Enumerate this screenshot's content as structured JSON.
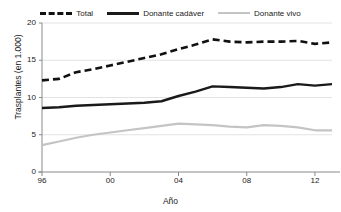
{
  "chart_data": {
    "type": "line",
    "title": "",
    "xlabel": "Año",
    "ylabel": "Trasplantes (en 1.000)",
    "xlim": [
      1996,
      2013
    ],
    "ylim": [
      0,
      20
    ],
    "grid": true,
    "legend_position": "top",
    "xticks": [
      "96",
      "00",
      "04",
      "08",
      "12"
    ],
    "xtick_values": [
      1996,
      2000,
      2004,
      2008,
      2012
    ],
    "yticks": [
      "0",
      "5",
      "10",
      "15",
      "20"
    ],
    "ytick_values": [
      0,
      5,
      10,
      15,
      20
    ],
    "x": [
      1996,
      1997,
      1998,
      1999,
      2000,
      2001,
      2002,
      2003,
      2004,
      2005,
      2006,
      2007,
      2008,
      2009,
      2010,
      2011,
      2012,
      2013
    ],
    "series": [
      {
        "name": "Total",
        "style": "dashed",
        "color": "#111111",
        "values": [
          12.3,
          12.5,
          13.4,
          13.8,
          14.3,
          14.8,
          15.3,
          15.8,
          16.5,
          17.1,
          17.8,
          17.5,
          17.4,
          17.5,
          17.5,
          17.6,
          17.2,
          17.4
        ]
      },
      {
        "name": "Donante cadáver",
        "style": "solid",
        "color": "#1a1a1a",
        "values": [
          8.6,
          8.7,
          8.9,
          9.0,
          9.1,
          9.2,
          9.3,
          9.5,
          10.2,
          10.8,
          11.5,
          11.4,
          11.3,
          11.2,
          11.4,
          11.8,
          11.6,
          11.8
        ]
      },
      {
        "name": "Donante vivo",
        "style": "solid",
        "color": "#c4c4c4",
        "values": [
          3.6,
          4.1,
          4.6,
          5.0,
          5.3,
          5.6,
          5.9,
          6.2,
          6.5,
          6.4,
          6.3,
          6.1,
          6.0,
          6.3,
          6.2,
          6.0,
          5.6,
          5.6
        ]
      }
    ]
  }
}
